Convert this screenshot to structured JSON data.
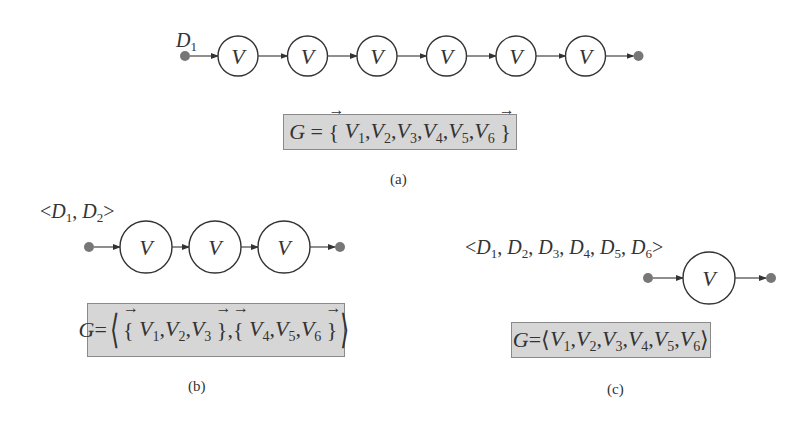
{
  "panels": {
    "a": {
      "input_label": "D",
      "input_sub": "1",
      "node_label": "V",
      "node_count": 6,
      "formula": {
        "lhs": "G",
        "eq": "=",
        "open": "{",
        "close": "}",
        "vars": [
          {
            "name": "V",
            "sub": "1"
          },
          {
            "name": "V",
            "sub": "2"
          },
          {
            "name": "V",
            "sub": "3"
          },
          {
            "name": "V",
            "sub": "4"
          },
          {
            "name": "V",
            "sub": "5"
          },
          {
            "name": "V",
            "sub": "6"
          }
        ]
      },
      "caption": "(a)"
    },
    "b": {
      "input_label": "<D1, D2>",
      "node_label": "V",
      "node_count": 3,
      "formula": {
        "lhs": "G",
        "eq": "=",
        "groups": [
          {
            "vars": [
              {
                "name": "V",
                "sub": "1"
              },
              {
                "name": "V",
                "sub": "2"
              },
              {
                "name": "V",
                "sub": "3"
              }
            ]
          },
          {
            "vars": [
              {
                "name": "V",
                "sub": "4"
              },
              {
                "name": "V",
                "sub": "5"
              },
              {
                "name": "V",
                "sub": "6"
              }
            ]
          }
        ]
      },
      "caption": "(b)"
    },
    "c": {
      "input_label": "<D1, D2, D3, D4, D5, D6>",
      "node_label": "V",
      "node_count": 1,
      "formula": {
        "lhs": "G",
        "eq": "=",
        "vars": [
          {
            "name": "V",
            "sub": "1"
          },
          {
            "name": "V",
            "sub": "2"
          },
          {
            "name": "V",
            "sub": "3"
          },
          {
            "name": "V",
            "sub": "4"
          },
          {
            "name": "V",
            "sub": "5"
          },
          {
            "name": "V",
            "sub": "6"
          }
        ]
      },
      "caption": "(c)"
    }
  },
  "colors": {
    "formula_bg": "#d6d6d6",
    "dot": "#777777",
    "stroke": "#333333"
  }
}
